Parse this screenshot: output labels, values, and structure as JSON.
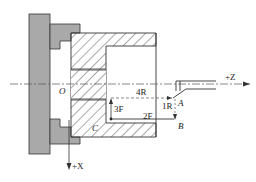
{
  "diagram": {
    "type": "lathe-turning-coordinate-diagram",
    "colors": {
      "chuck_fill": "#a9a9a9",
      "line": "#333333",
      "hatch": "#444444",
      "dashed": "#555555",
      "background": "#ffffff"
    },
    "labels": {
      "origin": "O",
      "z_axis": "+Z",
      "x_axis": "+X",
      "point_a": "A",
      "point_b": "B",
      "point_c": "C",
      "move_1": "1R",
      "move_2": "2F",
      "move_3": "3F",
      "move_4": "4R"
    }
  }
}
